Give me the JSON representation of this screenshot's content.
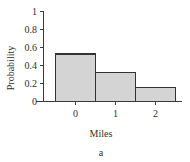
{
  "figure": {
    "caption": "a",
    "background_color": "#ffffff"
  },
  "chart_data": {
    "type": "bar",
    "title": "",
    "subtitle": "",
    "xlabel": "Miles",
    "ylabel": "Probability",
    "categories": [
      "0",
      "1",
      "2"
    ],
    "values": [
      0.53,
      0.32,
      0.155
    ],
    "series": [
      {
        "name": "Probability",
        "values": [
          0.53,
          0.32,
          0.155
        ]
      }
    ],
    "xlim": [
      -0.5,
      2.5
    ],
    "ylim": [
      0,
      1
    ],
    "yticks": [
      0,
      0.2,
      0.4,
      0.6,
      0.8,
      1
    ],
    "ytick_labels": [
      "0",
      "0.2",
      "0.4",
      "0.6",
      "0.8",
      "1"
    ],
    "xticks": [
      0,
      1,
      2
    ],
    "xtick_labels": [
      "0",
      "1",
      "2"
    ],
    "grid": false,
    "legend": false,
    "legend_position": "none",
    "bar_fill_color": "#d4d4d4",
    "bar_edge_color": "#333333",
    "axis_color": "#3a3a3a",
    "annotations": []
  }
}
